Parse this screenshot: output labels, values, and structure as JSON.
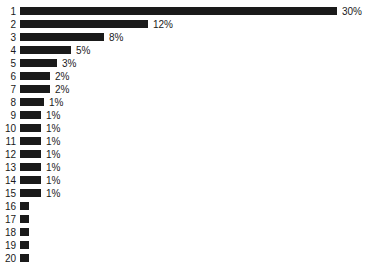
{
  "chart_data": {
    "type": "bar",
    "orientation": "horizontal",
    "title": "",
    "subtitle": "",
    "xlabel": "",
    "ylabel": "",
    "grid": false,
    "legend": false,
    "xlim": [
      0,
      30
    ],
    "axis_visible": false,
    "bar_color": "#1a1a1a",
    "background_color": "#ffffff",
    "label_color": "#1a1a1a",
    "value_suffix": "%",
    "categories": [
      "1",
      "2",
      "3",
      "4",
      "5",
      "6",
      "7",
      "8",
      "9",
      "10",
      "11",
      "12",
      "13",
      "14",
      "15",
      "16",
      "17",
      "18",
      "19",
      "20"
    ],
    "values": [
      30,
      12,
      8,
      5,
      3,
      2,
      2,
      1,
      1,
      1,
      1,
      1,
      1,
      1,
      1,
      0,
      0,
      0,
      0,
      0
    ],
    "value_labels": [
      "30%",
      "12%",
      "8%",
      "5%",
      "3%",
      "2%",
      "2%",
      "1%",
      "1%",
      "1%",
      "1%",
      "1%",
      "1%",
      "1%",
      "1%",
      "",
      "",
      "",
      "",
      ""
    ],
    "bars": [
      {
        "category": "1",
        "value": 30,
        "label": "30%",
        "bar_px": 317
      },
      {
        "category": "2",
        "value": 12,
        "label": "12%",
        "bar_px": 128
      },
      {
        "category": "3",
        "value": 8,
        "label": "8%",
        "bar_px": 84
      },
      {
        "category": "4",
        "value": 5,
        "label": "5%",
        "bar_px": 51
      },
      {
        "category": "5",
        "value": 3,
        "label": "3%",
        "bar_px": 37
      },
      {
        "category": "6",
        "value": 2,
        "label": "2%",
        "bar_px": 30
      },
      {
        "category": "7",
        "value": 2,
        "label": "2%",
        "bar_px": 30
      },
      {
        "category": "8",
        "value": 1,
        "label": "1%",
        "bar_px": 24
      },
      {
        "category": "9",
        "value": 1,
        "label": "1%",
        "bar_px": 21
      },
      {
        "category": "10",
        "value": 1,
        "label": "1%",
        "bar_px": 21
      },
      {
        "category": "11",
        "value": 1,
        "label": "1%",
        "bar_px": 21
      },
      {
        "category": "12",
        "value": 1,
        "label": "1%",
        "bar_px": 21
      },
      {
        "category": "13",
        "value": 1,
        "label": "1%",
        "bar_px": 21
      },
      {
        "category": "14",
        "value": 1,
        "label": "1%",
        "bar_px": 21
      },
      {
        "category": "15",
        "value": 1,
        "label": "1%",
        "bar_px": 21
      },
      {
        "category": "16",
        "value": 0,
        "label": "",
        "bar_px": 9
      },
      {
        "category": "17",
        "value": 0,
        "label": "",
        "bar_px": 9
      },
      {
        "category": "18",
        "value": 0,
        "label": "",
        "bar_px": 9
      },
      {
        "category": "19",
        "value": 0,
        "label": "",
        "bar_px": 9
      },
      {
        "category": "20",
        "value": 0,
        "label": "",
        "bar_px": 9
      }
    ]
  }
}
